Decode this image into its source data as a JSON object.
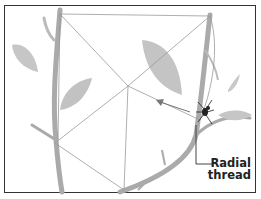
{
  "figure": {
    "label": {
      "line1": "Radial",
      "line2": "thread"
    },
    "colors": {
      "frame": "#333333",
      "stem": "#a9a9a9",
      "leaf": "#c4c4c4",
      "web_thread": "#9a9a9a",
      "spider": "#222222",
      "label_text": "#222222"
    }
  }
}
